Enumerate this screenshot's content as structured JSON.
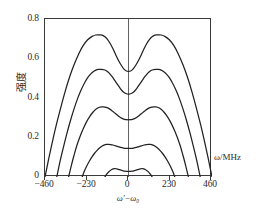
{
  "chart_data": {
    "type": "line",
    "title": "",
    "subtitle": "",
    "xlabel": "ω'−ω₀",
    "ylabel": "强度",
    "x_unit_label": "ω/MHz",
    "xlim": [
      -460,
      460
    ],
    "ylim": [
      0,
      0.8
    ],
    "grid": false,
    "legend": "none",
    "x_ticks": [
      -460,
      -230,
      0,
      230,
      460
    ],
    "x_tick_labels": [
      "−460",
      "−230",
      "0",
      "230",
      "460"
    ],
    "y_ticks": [
      0,
      0.2,
      0.4,
      0.6,
      0.8
    ],
    "y_tick_labels": [
      "0",
      "0.2",
      "0.4",
      "0.6",
      "0.8"
    ],
    "line_color": "#222222",
    "line_width": 1.25,
    "series": [
      {
        "name": "curve-1",
        "peak_value": 0.72,
        "peak_positions": [
          -155,
          155
        ],
        "center_dip_value": 0.535,
        "zero_crossings": [
          -460,
          460
        ],
        "x": [
          -460,
          -440,
          -420,
          -400,
          -375,
          -350,
          -325,
          -300,
          -275,
          -250,
          -225,
          -200,
          -180,
          -165,
          -155,
          -145,
          -130,
          -115,
          -100,
          -85,
          -70,
          -55,
          -40,
          -25,
          -12,
          0,
          12,
          25,
          40,
          55,
          70,
          85,
          100,
          115,
          130,
          145,
          155,
          165,
          180,
          200,
          225,
          250,
          275,
          300,
          325,
          350,
          375,
          400,
          420,
          440,
          460
        ],
        "y": [
          0.0,
          0.09,
          0.175,
          0.255,
          0.345,
          0.43,
          0.505,
          0.568,
          0.622,
          0.665,
          0.695,
          0.712,
          0.719,
          0.72,
          0.72,
          0.718,
          0.71,
          0.696,
          0.675,
          0.648,
          0.618,
          0.59,
          0.566,
          0.546,
          0.537,
          0.535,
          0.537,
          0.546,
          0.566,
          0.59,
          0.618,
          0.648,
          0.675,
          0.696,
          0.71,
          0.718,
          0.72,
          0.72,
          0.719,
          0.712,
          0.695,
          0.665,
          0.622,
          0.568,
          0.505,
          0.43,
          0.345,
          0.255,
          0.175,
          0.09,
          0.0
        ]
      },
      {
        "name": "curve-2",
        "peak_value": 0.545,
        "peak_positions": [
          -150,
          150
        ],
        "center_dip_value": 0.42,
        "zero_crossings": [
          -395,
          395
        ],
        "x": [
          -395,
          -378,
          -360,
          -340,
          -320,
          -300,
          -280,
          -260,
          -240,
          -220,
          -200,
          -180,
          -165,
          -150,
          -135,
          -120,
          -105,
          -90,
          -75,
          -60,
          -45,
          -30,
          -15,
          0,
          15,
          30,
          45,
          60,
          75,
          90,
          105,
          120,
          135,
          150,
          165,
          180,
          200,
          220,
          240,
          260,
          280,
          300,
          320,
          340,
          360,
          378,
          395
        ],
        "y": [
          0.0,
          0.075,
          0.145,
          0.218,
          0.285,
          0.345,
          0.398,
          0.443,
          0.48,
          0.509,
          0.529,
          0.541,
          0.545,
          0.545,
          0.543,
          0.537,
          0.525,
          0.508,
          0.488,
          0.468,
          0.448,
          0.432,
          0.423,
          0.42,
          0.423,
          0.432,
          0.448,
          0.468,
          0.488,
          0.508,
          0.525,
          0.537,
          0.543,
          0.545,
          0.545,
          0.541,
          0.529,
          0.509,
          0.48,
          0.443,
          0.398,
          0.345,
          0.285,
          0.218,
          0.145,
          0.075,
          0.0
        ]
      },
      {
        "name": "curve-3",
        "peak_value": 0.355,
        "peak_positions": [
          -140,
          140
        ],
        "center_dip_value": 0.29,
        "zero_crossings": [
          -330,
          330
        ],
        "x": [
          -330,
          -315,
          -300,
          -285,
          -268,
          -250,
          -232,
          -214,
          -196,
          -178,
          -160,
          -148,
          -140,
          -130,
          -118,
          -105,
          -92,
          -78,
          -64,
          -50,
          -36,
          -22,
          -10,
          0,
          10,
          22,
          36,
          50,
          64,
          78,
          92,
          105,
          118,
          130,
          140,
          148,
          160,
          178,
          196,
          214,
          232,
          250,
          268,
          285,
          300,
          315,
          330
        ],
        "y": [
          0.0,
          0.058,
          0.11,
          0.158,
          0.203,
          0.243,
          0.278,
          0.306,
          0.328,
          0.344,
          0.353,
          0.355,
          0.355,
          0.354,
          0.351,
          0.345,
          0.336,
          0.326,
          0.315,
          0.305,
          0.297,
          0.292,
          0.29,
          0.29,
          0.29,
          0.292,
          0.297,
          0.305,
          0.315,
          0.326,
          0.336,
          0.345,
          0.351,
          0.354,
          0.355,
          0.355,
          0.353,
          0.344,
          0.328,
          0.306,
          0.278,
          0.243,
          0.203,
          0.158,
          0.11,
          0.058,
          0.0
        ]
      },
      {
        "name": "curve-4",
        "peak_value": 0.165,
        "peak_positions": [
          -120,
          120
        ],
        "center_dip_value": 0.145,
        "zero_crossings": [
          -255,
          255
        ],
        "x": [
          -255,
          -243,
          -230,
          -216,
          -202,
          -188,
          -173,
          -158,
          -145,
          -132,
          -120,
          -110,
          -98,
          -86,
          -72,
          -58,
          -44,
          -30,
          -16,
          0,
          16,
          30,
          44,
          58,
          72,
          86,
          98,
          110,
          120,
          132,
          145,
          158,
          173,
          188,
          202,
          216,
          230,
          243,
          255
        ],
        "y": [
          0.0,
          0.03,
          0.056,
          0.08,
          0.101,
          0.119,
          0.135,
          0.148,
          0.157,
          0.163,
          0.165,
          0.165,
          0.164,
          0.162,
          0.158,
          0.154,
          0.15,
          0.147,
          0.145,
          0.145,
          0.145,
          0.147,
          0.15,
          0.154,
          0.158,
          0.162,
          0.164,
          0.165,
          0.165,
          0.163,
          0.157,
          0.148,
          0.135,
          0.119,
          0.101,
          0.08,
          0.056,
          0.03,
          0.0
        ]
      },
      {
        "name": "curve-5",
        "peak_value": 0.042,
        "peak_positions": [
          -72,
          72
        ],
        "center_dip_value": 0.028,
        "zero_crossings": [
          -130,
          130
        ],
        "x": [
          -130,
          -124,
          -116,
          -108,
          -100,
          -92,
          -84,
          -76,
          -72,
          -64,
          -56,
          -46,
          -36,
          -26,
          -14,
          0,
          14,
          26,
          36,
          46,
          56,
          64,
          72,
          76,
          84,
          92,
          100,
          108,
          116,
          124,
          130
        ],
        "y": [
          0.0,
          0.01,
          0.019,
          0.027,
          0.033,
          0.038,
          0.041,
          0.042,
          0.042,
          0.041,
          0.039,
          0.036,
          0.033,
          0.03,
          0.029,
          0.028,
          0.029,
          0.03,
          0.033,
          0.036,
          0.039,
          0.041,
          0.042,
          0.042,
          0.041,
          0.038,
          0.033,
          0.027,
          0.019,
          0.01,
          0.0
        ]
      }
    ]
  }
}
